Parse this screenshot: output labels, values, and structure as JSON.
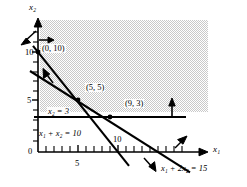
{
  "figure": {
    "type": "linear-programming-feasible-region",
    "axes": {
      "x_label": "x₁",
      "y_label": "x₂",
      "origin_label": "0",
      "x_ticks": [
        {
          "value": 5,
          "label": "5"
        },
        {
          "value": 10,
          "label": "10"
        }
      ],
      "y_ticks": [
        {
          "value": 5,
          "label": "5"
        },
        {
          "value": 10,
          "label": "10"
        }
      ],
      "x_range": [
        0,
        18
      ],
      "y_range": [
        0,
        13
      ]
    },
    "constraints": [
      {
        "id": "c1",
        "label": "x₁ + 2x₂ = 15",
        "type": "line",
        "intercepts": {
          "x": 15,
          "y": 7.5
        },
        "direction_arrow": "down-left"
      },
      {
        "id": "c2",
        "label": "x₁ + x₂ = 10",
        "type": "line",
        "intercepts": {
          "x": 10,
          "y": 10
        },
        "direction_arrow": "down-left"
      },
      {
        "id": "c3",
        "label": "x₂ = 3",
        "type": "horizontal-line",
        "value": 3,
        "direction_arrow": "up"
      }
    ],
    "vertices": [
      {
        "label": "(0, 10)",
        "x": 0,
        "y": 10
      },
      {
        "label": "(5, 5)",
        "x": 5,
        "y": 5
      },
      {
        "label": "(9, 3)",
        "x": 9,
        "y": 3
      }
    ],
    "shaded_region": {
      "description": "feasible-region-shading",
      "color": "#e4e4e4"
    },
    "colors": {
      "line": "#000000",
      "shade": "#e4e4e4",
      "background": "#ffffff"
    }
  }
}
